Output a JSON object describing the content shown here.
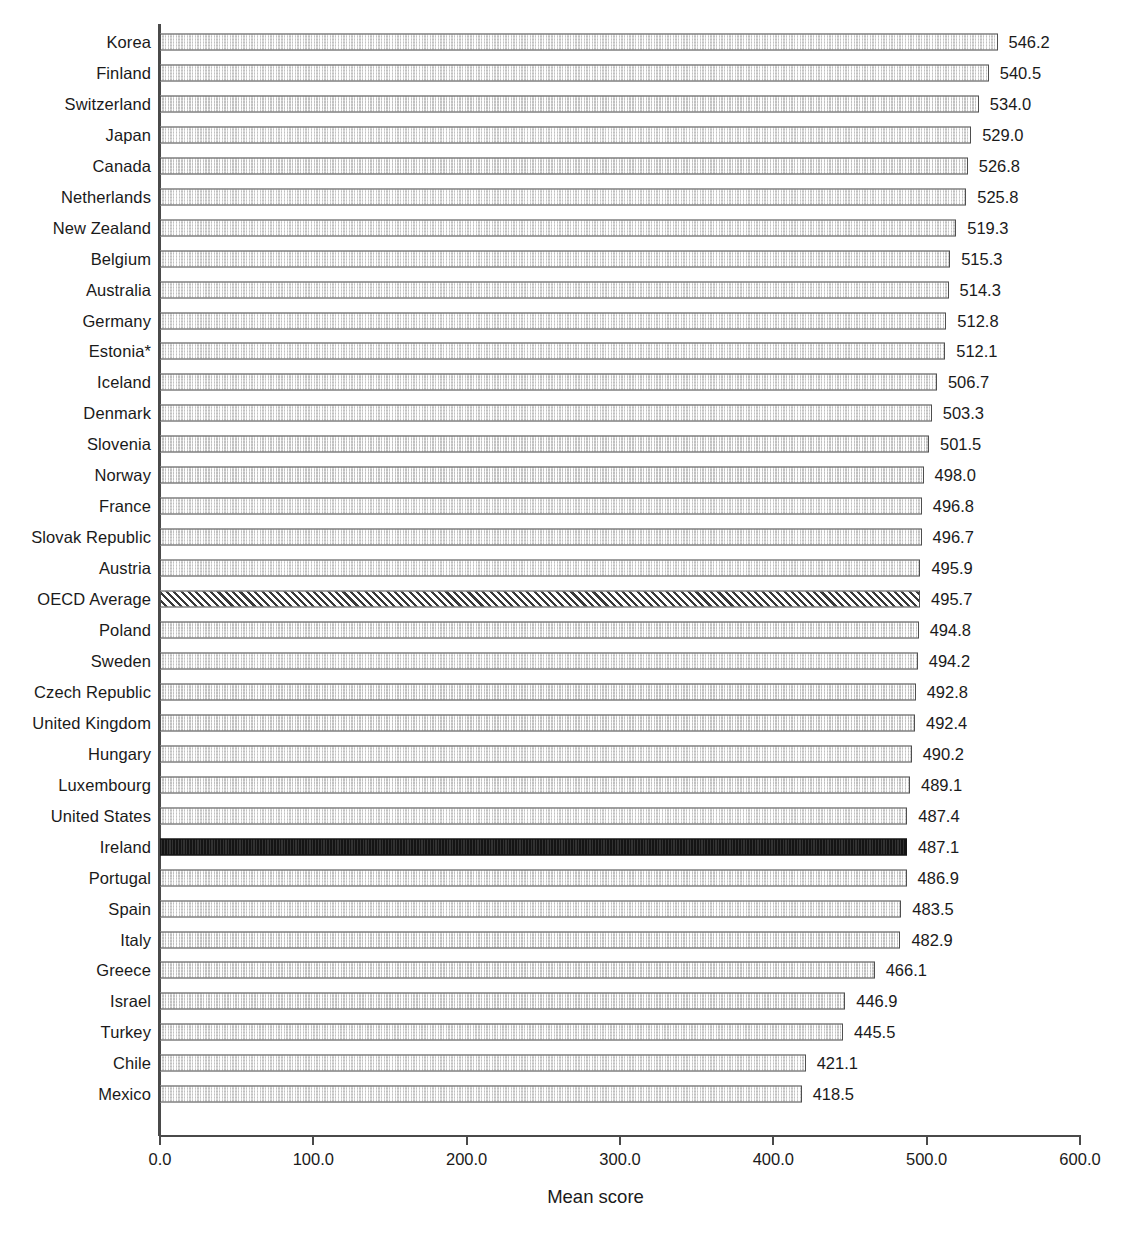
{
  "chart_data": {
    "type": "bar",
    "orientation": "horizontal",
    "title": "",
    "subtitle": "",
    "xlabel": "Mean score",
    "ylabel": "",
    "xlim": [
      0,
      600
    ],
    "ylim": null,
    "grid": false,
    "legend": null,
    "xticks": [
      "0.0",
      "100.0",
      "200.0",
      "300.0",
      "400.0",
      "500.0",
      "600.0"
    ],
    "xtick_values": [
      0,
      100,
      200,
      300,
      400,
      500,
      600
    ],
    "categories": [
      "Korea",
      "Finland",
      "Switzerland",
      "Japan",
      "Canada",
      "Netherlands",
      "New Zealand",
      "Belgium",
      "Australia",
      "Germany",
      "Estonia*",
      "Iceland",
      "Denmark",
      "Slovenia",
      "Norway",
      "France",
      "Slovak Republic",
      "Austria",
      "OECD Average",
      "Poland",
      "Sweden",
      "Czech Republic",
      "United Kingdom",
      "Hungary",
      "Luxembourg",
      "United States",
      "Ireland",
      "Portugal",
      "Spain",
      "Italy",
      "Greece",
      "Israel",
      "Turkey",
      "Chile",
      "Mexico"
    ],
    "values": [
      546.2,
      540.5,
      534.0,
      529.0,
      526.8,
      525.8,
      519.3,
      515.3,
      514.3,
      512.8,
      512.1,
      506.7,
      503.3,
      501.5,
      498.0,
      496.8,
      496.7,
      495.9,
      495.7,
      494.8,
      494.2,
      492.8,
      492.4,
      490.2,
      489.1,
      487.4,
      487.1,
      486.9,
      483.5,
      482.9,
      466.1,
      446.9,
      445.5,
      421.1,
      418.5
    ],
    "value_labels": [
      "546.2",
      "540.5",
      "534.0",
      "529.0",
      "526.8",
      "525.8",
      "519.3",
      "515.3",
      "514.3",
      "512.8",
      "512.1",
      "506.7",
      "503.3",
      "501.5",
      "498.0",
      "496.8",
      "496.7",
      "495.9",
      "495.7",
      "494.8",
      "494.2",
      "492.8",
      "492.4",
      "490.2",
      "489.1",
      "487.4",
      "487.1",
      "486.9",
      "483.5",
      "482.9",
      "466.1",
      "446.9",
      "445.5",
      "421.1",
      "418.5"
    ],
    "bar_styles": [
      "default",
      "default",
      "default",
      "default",
      "default",
      "default",
      "default",
      "default",
      "default",
      "default",
      "default",
      "default",
      "default",
      "default",
      "default",
      "default",
      "default",
      "default",
      "hatch",
      "default",
      "default",
      "default",
      "default",
      "default",
      "default",
      "default",
      "highlight",
      "default",
      "default",
      "default",
      "default",
      "default",
      "default",
      "default",
      "default"
    ],
    "colors": {
      "bar_fill": "#e2e2e2",
      "bar_border": "#4f4f4f",
      "highlight_fill": "#141414",
      "hatch_fill": "#f2f2f2",
      "axis": "#4a4a4a",
      "text": "#1a1a1a",
      "background": "#ffffff"
    }
  }
}
